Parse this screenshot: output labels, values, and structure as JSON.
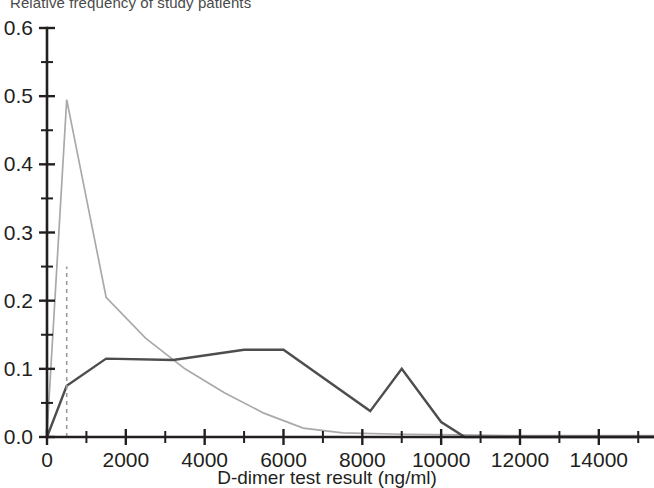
{
  "figure": {
    "ylabel_top": "Relative frequency of study patients",
    "xlabel": "D-dimer test result (ng/ml)"
  },
  "axes": {
    "y_ticks": [
      "0.0",
      "0.1",
      "0.2",
      "0.3",
      "0.4",
      "0.5",
      "0.6"
    ],
    "x_ticks": [
      "0",
      "2000",
      "4000",
      "6000",
      "8000",
      "10000",
      "12000",
      "14000"
    ]
  },
  "colors": {
    "series_negative": "#a9a9a9",
    "series_positive": "#4d4d4d",
    "cutoff": "#9a9a9a",
    "axis": "#231f20"
  },
  "chart_data": {
    "type": "line",
    "title": "",
    "xlabel": "D-dimer test result (ng/ml)",
    "ylabel": "Relative frequency of study patients",
    "xlim": [
      0,
      15400
    ],
    "ylim": [
      0.0,
      0.6
    ],
    "xticks": [
      0,
      2000,
      4000,
      6000,
      8000,
      10000,
      12000,
      14000
    ],
    "xticks_minor_step": 1000,
    "yticks": [
      0.0,
      0.1,
      0.2,
      0.3,
      0.4,
      0.5,
      0.6
    ],
    "yticks_minor_step": 0.05,
    "grid": false,
    "legend": "none",
    "annotations": [
      {
        "name": "cutoff-500",
        "type": "vertical-dashed-line",
        "x": 500,
        "y_from": 0.0,
        "y_to": 0.25
      }
    ],
    "series": [
      {
        "name": "Patients without pulmonary embolism",
        "color": "#a9a9a9",
        "x": [
          0,
          500,
          1500,
          2500,
          3500,
          4500,
          5500,
          6500,
          7500,
          9000,
          10500,
          12000,
          13500,
          15400
        ],
        "values": [
          0.005,
          0.495,
          0.205,
          0.145,
          0.1,
          0.065,
          0.035,
          0.013,
          0.006,
          0.004,
          0.003,
          0.002,
          0.002,
          0.002
        ]
      },
      {
        "name": "Patients with pulmonary embolism",
        "color": "#4d4d4d",
        "x": [
          0,
          500,
          1500,
          3200,
          5000,
          6000,
          8200,
          9000,
          10000,
          10600,
          15400
        ],
        "values": [
          0.0,
          0.075,
          0.115,
          0.113,
          0.128,
          0.128,
          0.038,
          0.1,
          0.022,
          0.0,
          0.0
        ]
      }
    ]
  }
}
